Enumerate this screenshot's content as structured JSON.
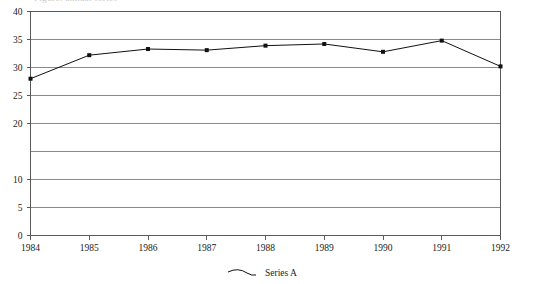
{
  "title_clipped": "Figure: annual series",
  "chart_data": {
    "type": "line",
    "title": "",
    "xlabel": "",
    "ylabel": "",
    "categories": [
      "1984",
      "1985",
      "1986",
      "1987",
      "1988",
      "1989",
      "1990",
      "1991",
      "1992"
    ],
    "series": [
      {
        "name": "Series A",
        "values": [
          28.0,
          32.2,
          33.3,
          33.1,
          33.9,
          34.2,
          32.8,
          34.8,
          30.2
        ]
      }
    ],
    "ylim": [
      0,
      40
    ],
    "ytick_labels": [
      "40",
      "35",
      "30",
      "25",
      "20",
      "10",
      "5",
      "0"
    ],
    "ytick_values": [
      40,
      35,
      30,
      25,
      20,
      15,
      10,
      5,
      0
    ],
    "grid": true,
    "legend_position": "bottom",
    "marker": "square",
    "line_color": "#111111",
    "grid_color": "#8a8a8a",
    "frame_color": "#5a5a5a"
  },
  "legend": {
    "entries": [
      {
        "label": "Series A"
      }
    ]
  }
}
